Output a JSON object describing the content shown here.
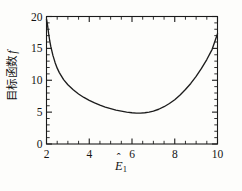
{
  "figure": {
    "background_color": "#fdfdfb",
    "axis_color": "#1a1a1a",
    "curve_color": "#1d1d1d"
  },
  "axes": {
    "x_title_symbol": "E",
    "x_title_hat": "ˆ",
    "x_title_subscript": "1",
    "y_title_text": "目标函数",
    "y_title_symbol": "f",
    "x_tick_labels": [
      "2",
      "4",
      "6",
      "8",
      "10"
    ],
    "y_tick_labels": [
      "0",
      "5",
      "10",
      "15",
      "20"
    ]
  },
  "chart_data": {
    "type": "line",
    "title": "",
    "subtitle": "",
    "xlabel": "Ê₁",
    "ylabel": "目标函数 f",
    "xlim": [
      2,
      10
    ],
    "ylim": [
      0,
      20
    ],
    "xticks": [
      2,
      4,
      6,
      8,
      10
    ],
    "yticks": [
      0,
      5,
      10,
      15,
      20
    ],
    "x_minor_tick_step": 0.5,
    "y_minor_tick_step": 1,
    "grid": false,
    "legend": null,
    "legend_position": "none",
    "annotations": [],
    "series": [
      {
        "name": "目标函数 f",
        "color": "#1d1d1d",
        "line_width": 1.35,
        "marker": "none",
        "x": [
          2.0,
          2.05,
          2.1,
          2.15,
          2.2,
          2.3,
          2.4,
          2.5,
          2.6,
          2.8,
          3.0,
          3.25,
          3.5,
          3.75,
          4.0,
          4.25,
          4.5,
          4.75,
          5.0,
          5.25,
          5.5,
          5.75,
          6.0,
          6.2,
          6.4,
          6.6,
          6.8,
          7.0,
          7.25,
          7.5,
          7.75,
          8.0,
          8.25,
          8.5,
          8.75,
          9.0,
          9.25,
          9.5,
          9.75,
          10.0
        ],
        "y": [
          19.6,
          18.6,
          17.3,
          16.2,
          15.3,
          13.9,
          12.8,
          11.9,
          11.2,
          10.1,
          9.3,
          8.5,
          7.85,
          7.3,
          6.85,
          6.45,
          6.1,
          5.8,
          5.55,
          5.32,
          5.15,
          5.0,
          4.9,
          4.85,
          4.85,
          4.9,
          5.0,
          5.15,
          5.45,
          5.85,
          6.35,
          6.95,
          7.7,
          8.55,
          9.5,
          10.6,
          11.85,
          13.25,
          14.85,
          17.3
        ]
      }
    ],
    "minimum_point": {
      "x": 6.2,
      "y": 4.85
    },
    "endpoints": {
      "left": {
        "x": 2,
        "y": 19.6
      },
      "right": {
        "x": 10,
        "y": 17.3
      }
    }
  }
}
